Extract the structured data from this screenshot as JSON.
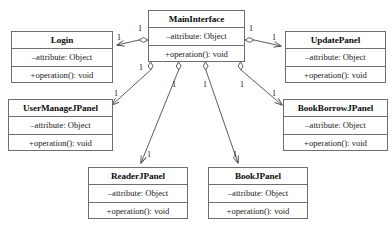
{
  "diagram": {
    "type": "uml-class-diagram",
    "relationship_kind": "aggregation",
    "classes": [
      {
        "id": "mainInterface",
        "name": "MainInterface",
        "attribute": "–attribute: Object",
        "operation": "+operation(): void",
        "x": 148,
        "y": 10,
        "w": 97,
        "h": 52
      },
      {
        "id": "login",
        "name": "Login",
        "attribute": "–attribute: Object",
        "operation": "+operation(): void",
        "x": 11,
        "y": 31,
        "w": 102,
        "h": 52
      },
      {
        "id": "updatePanel",
        "name": "UpdatePanel",
        "attribute": "–attribute: Object",
        "operation": "+operation(): void",
        "x": 285,
        "y": 31,
        "w": 101,
        "h": 52
      },
      {
        "id": "userManageJPanel",
        "name": "UserManageJPanel",
        "attribute": "–attribute: Object",
        "operation": "+operation(): void",
        "x": 8,
        "y": 99,
        "w": 105,
        "h": 52
      },
      {
        "id": "bookBorrowJPanel",
        "name": "BookBorrowJPanel",
        "attribute": "–attribute: Object",
        "operation": "+operation(): void",
        "x": 283,
        "y": 99,
        "w": 105,
        "h": 52
      },
      {
        "id": "readerJPanel",
        "name": "ReaderJPanel",
        "attribute": "–attribute: Object",
        "operation": "+operation(): void",
        "x": 88,
        "y": 167,
        "w": 100,
        "h": 52
      },
      {
        "id": "bookJPanel",
        "name": "BookJPanel",
        "attribute": "–attribute: Object",
        "operation": "+operation(): void",
        "x": 208,
        "y": 167,
        "w": 100,
        "h": 52
      }
    ],
    "associations": [
      {
        "id": "main-login",
        "from": "mainInterface",
        "to": "login",
        "whole_multiplicity": "1",
        "part_multiplicity": "1",
        "whole_label_x": 138,
        "whole_label_y": 24,
        "part_label_x": 117,
        "part_label_y": 33
      },
      {
        "id": "main-updatePanel",
        "from": "mainInterface",
        "to": "updatePanel",
        "whole_multiplicity": "1",
        "part_multiplicity": "1",
        "whole_label_x": 249,
        "whole_label_y": 24,
        "part_label_x": 272,
        "part_label_y": 33
      },
      {
        "id": "main-userManageJPanel",
        "from": "mainInterface",
        "to": "userManageJPanel",
        "whole_multiplicity": "1",
        "part_multiplicity": "1",
        "whole_label_x": 139,
        "whole_label_y": 63,
        "part_label_x": 114,
        "part_label_y": 89
      },
      {
        "id": "main-bookBorrowJPanel",
        "from": "mainInterface",
        "to": "bookBorrowJPanel",
        "whole_multiplicity": "1",
        "part_multiplicity": "1",
        "whole_label_x": 240,
        "whole_label_y": 80,
        "part_label_x": 272,
        "part_label_y": 89
      },
      {
        "id": "main-readerJPanel",
        "from": "mainInterface",
        "to": "readerJPanel",
        "whole_multiplicity": "1",
        "part_multiplicity": "1",
        "whole_label_x": 172,
        "whole_label_y": 80,
        "part_label_x": 147,
        "part_label_y": 150
      },
      {
        "id": "main-bookJPanel",
        "from": "mainInterface",
        "to": "bookJPanel",
        "whole_multiplicity": "1",
        "part_multiplicity": "1",
        "whole_label_x": 203,
        "whole_label_y": 80,
        "part_label_x": 233,
        "part_label_y": 150
      }
    ]
  },
  "caption": {
    "text": "",
    "y": 227
  },
  "colors": {
    "box_border": "#6f6f6f",
    "box_fill": "#ffffff",
    "line": "#4a4a4a",
    "text": "#111111",
    "page_background": "#ffffff"
  }
}
